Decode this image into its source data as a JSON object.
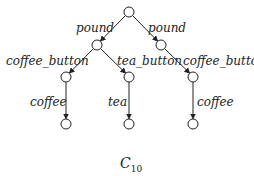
{
  "diagram": {
    "caption": {
      "main": "C",
      "subscript": "10"
    },
    "nodes": [
      {
        "id": "root",
        "x": 129,
        "y": 12
      },
      {
        "id": "n1",
        "x": 97,
        "y": 45
      },
      {
        "id": "n2",
        "x": 161,
        "y": 45
      },
      {
        "id": "n3",
        "x": 66,
        "y": 77
      },
      {
        "id": "n4",
        "x": 129,
        "y": 77
      },
      {
        "id": "n5",
        "x": 193,
        "y": 77
      },
      {
        "id": "n6",
        "x": 66,
        "y": 124
      },
      {
        "id": "n7",
        "x": 129,
        "y": 124
      },
      {
        "id": "n8",
        "x": 193,
        "y": 124
      }
    ],
    "edges": [
      {
        "from": "root",
        "to": "n1",
        "label": "pound"
      },
      {
        "from": "root",
        "to": "n2",
        "label": "pound"
      },
      {
        "from": "n1",
        "to": "n3",
        "label": "coffee_button"
      },
      {
        "from": "n1",
        "to": "n4",
        "label": "tea_button"
      },
      {
        "from": "n2",
        "to": "n5",
        "label": "coffee_button"
      },
      {
        "from": "n3",
        "to": "n6",
        "label": "coffee"
      },
      {
        "from": "n4",
        "to": "n7",
        "label": "tea"
      },
      {
        "from": "n5",
        "to": "n8",
        "label": "coffee"
      }
    ]
  }
}
